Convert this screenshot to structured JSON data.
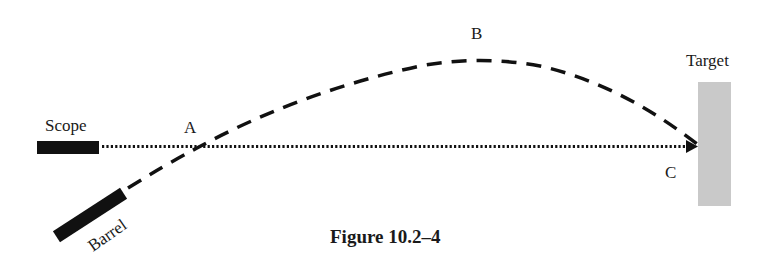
{
  "figure": {
    "caption": "Figure 10.2–4",
    "labels": {
      "scope": "Scope",
      "barrel": "Barrel",
      "target": "Target",
      "point_a": "A",
      "point_b": "B",
      "point_c": "C"
    },
    "colors": {
      "ink": "#111111",
      "target_fill": "#c9c9c9"
    },
    "elements": {
      "scope_line": "dotted line of sight from scope to point C on target",
      "trajectory": "dashed parabolic bullet path from barrel through A, peaking at B, ending at C"
    }
  }
}
